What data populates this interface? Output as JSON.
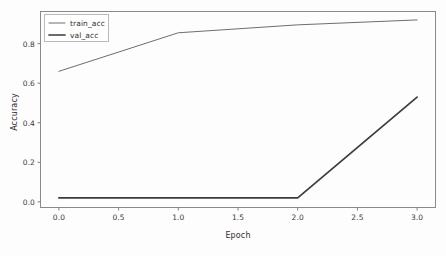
{
  "chart_data": {
    "type": "line",
    "title": "",
    "xlabel": "Epoch",
    "ylabel": "Accuracy",
    "x": [
      0,
      1,
      2,
      3
    ],
    "xlim": [
      -0.15,
      3.15
    ],
    "ylim": [
      -0.026,
      0.96
    ],
    "xticks": [
      0.0,
      0.5,
      1.0,
      1.5,
      2.0,
      2.5,
      3.0
    ],
    "xticklabels": [
      "0.0",
      "0.5",
      "1.0",
      "1.5",
      "2.0",
      "2.5",
      "3.0"
    ],
    "yticks": [
      0.0,
      0.2,
      0.4,
      0.6,
      0.8
    ],
    "yticklabels": [
      "0.0",
      "0.2",
      "0.4",
      "0.6",
      "0.8"
    ],
    "grid": false,
    "legend_position": "upper left",
    "series": [
      {
        "name": "train_acc",
        "values": [
          0.66,
          0.855,
          0.895,
          0.92
        ],
        "color": "#6e6e6e",
        "linewidth": 1.0
      },
      {
        "name": "val_acc",
        "values": [
          0.02,
          0.02,
          0.02,
          0.53
        ],
        "color": "#3c3c3c",
        "linewidth": 1.7
      }
    ]
  },
  "figure": {
    "background_color": "#fdfdfd",
    "axes_color": "#808080",
    "tick_color": "#808080"
  },
  "legend": {
    "entries": [
      {
        "label": "train_acc"
      },
      {
        "label": "val_acc"
      }
    ]
  }
}
